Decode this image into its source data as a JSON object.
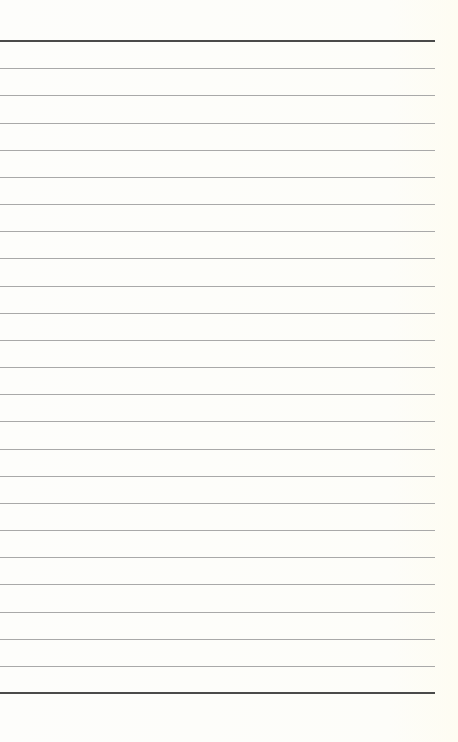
{
  "page": {
    "type": "lined-paper",
    "background_color": "#fdfdfb",
    "line_color": "#a9a9a9",
    "border_line_color": "#4a4a4a",
    "top_rule_y": 41,
    "bottom_rule_y": 693,
    "line_count": 25,
    "line_spacing": 27.17,
    "line_left": 0,
    "line_right": 435
  }
}
